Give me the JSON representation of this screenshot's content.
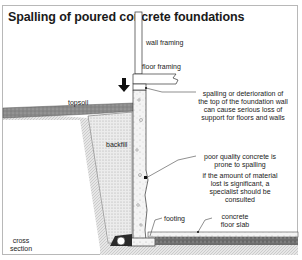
{
  "title": "Spalling of poured concrete foundations",
  "labels": {
    "wall_framing": "wall framing",
    "floor_framing": "floor framing",
    "topsoil": "topsoil",
    "backfill": "backfill",
    "footing": "footing",
    "floor_slab_1": "concrete",
    "floor_slab_2": "floor slab",
    "cross_section_1": "cross",
    "cross_section_2": "section"
  },
  "callouts": {
    "spalling_top": [
      "spalling or deterioration of",
      "the top of the foundation wall",
      "can cause serious loss of",
      "support for floors and walls"
    ],
    "poor_quality": [
      "poor quality concrete is",
      "prone to spalling"
    ],
    "specialist": [
      "if the amount of material",
      "lost is significant, a",
      "specialist should be",
      "consulted"
    ]
  },
  "colors": {
    "frame": "#b8b8b8",
    "topsoil": "#8a8a8a",
    "backfill": "#e4e4e4",
    "concrete": "#f2f2f2",
    "gravel": "#6e6e6e",
    "line": "#333333"
  }
}
